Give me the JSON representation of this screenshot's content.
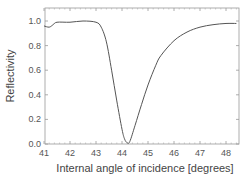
{
  "chart_data": {
    "type": "line",
    "title": "",
    "xlabel": "Internal angle of incidence [degrees]",
    "ylabel": "Reflectivity",
    "xlim": [
      41,
      48.5
    ],
    "ylim": [
      0,
      1.1
    ],
    "xticks": [
      "41",
      "42",
      "43",
      "44",
      "45",
      "46",
      "47",
      "48"
    ],
    "yticks": [
      "0.0",
      "0.2",
      "0.4",
      "0.6",
      "0.8",
      "1.0"
    ],
    "grid": false,
    "legend": null,
    "series": [
      {
        "name": "Reflectivity",
        "color": "#555555",
        "x": [
          41.0,
          41.2,
          41.35,
          41.5,
          42.0,
          42.5,
          43.0,
          43.2,
          43.4,
          43.6,
          43.8,
          44.0,
          44.1,
          44.2,
          44.3,
          44.5,
          44.75,
          45.0,
          45.3,
          45.5,
          46.0,
          46.5,
          47.0,
          47.5,
          48.0,
          48.4
        ],
        "values": [
          0.96,
          0.95,
          0.97,
          0.99,
          0.99,
          1.0,
          0.99,
          0.95,
          0.83,
          0.6,
          0.35,
          0.12,
          0.04,
          0.01,
          0.02,
          0.15,
          0.32,
          0.48,
          0.64,
          0.72,
          0.84,
          0.91,
          0.95,
          0.97,
          0.98,
          0.98
        ]
      }
    ]
  }
}
